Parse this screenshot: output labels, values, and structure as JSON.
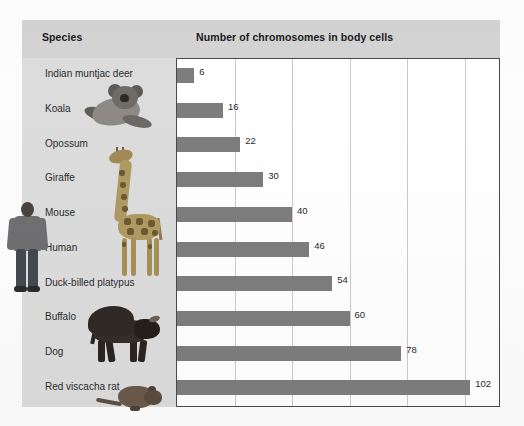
{
  "figure": {
    "species_header": "Species",
    "chart_header": "Number of chromosomes in body cells"
  },
  "colors": {
    "bar": "#7d7d7d",
    "panel": "#dcdcdc",
    "header_band": "#d4d4d4",
    "gridline": "#c9c9c9",
    "frame": "#4a4a4a",
    "text": "#2b2b2b"
  },
  "chart_data": {
    "type": "bar",
    "orientation": "horizontal",
    "title": "Number of chromosomes in body cells",
    "xlabel": "Number of chromosomes in body cells",
    "ylabel": "Species",
    "categories": [
      "Indian muntjac deer",
      "Koala",
      "Opossum",
      "Giraffe",
      "Mouse",
      "Human",
      "Duck-billed platypus",
      "Buffalo",
      "Dog",
      "Red viscacha rat"
    ],
    "values": [
      6,
      16,
      22,
      30,
      40,
      46,
      54,
      60,
      78,
      102
    ],
    "data_labels": [
      "6",
      "16",
      "22",
      "30",
      "40",
      "46",
      "54",
      "60",
      "78",
      "102"
    ],
    "xlim": [
      0,
      112
    ],
    "grid": "vertical",
    "gridline_values": [
      0,
      20,
      40,
      60,
      80,
      100
    ],
    "legend": "none",
    "tick_labels": []
  },
  "images": {
    "koala": "koala-photo",
    "giraffe": "giraffe-photo",
    "human": "human-photo",
    "buffalo": "buffalo-photo",
    "rat": "red-viscacha-rat-photo"
  }
}
